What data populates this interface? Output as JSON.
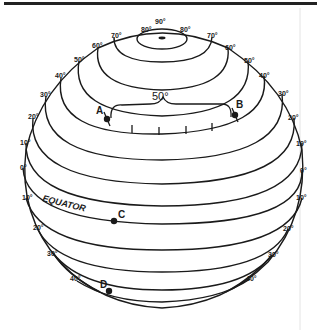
{
  "diagram": {
    "type": "globe-latitude-lines",
    "colors": {
      "line": "#1a1a1a",
      "background": "#ffffff",
      "frame": "#222222"
    },
    "pole_label": "90°",
    "equator_label": "EQUATOR",
    "arc_label": "50°",
    "left_labels": [
      "60°",
      "50°",
      "40°",
      "30°",
      "20°",
      "10°",
      "0°",
      "10°",
      "20°",
      "30°",
      "40°"
    ],
    "right_labels": [
      "70°",
      "60°",
      "50°",
      "40°",
      "30°",
      "20°",
      "10°",
      "0°",
      "10°",
      "20°",
      "30°",
      "40°"
    ],
    "top_labels": {
      "left_70": "70°",
      "left_80": "80°",
      "right_80": "80°"
    },
    "points": [
      {
        "id": "A",
        "label": "A"
      },
      {
        "id": "B",
        "label": "B"
      },
      {
        "id": "C",
        "label": "C"
      },
      {
        "id": "D",
        "label": "D"
      }
    ]
  }
}
